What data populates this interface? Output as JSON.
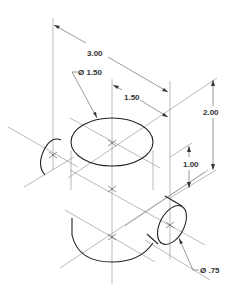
{
  "drawing": {
    "type": "isometric technical drawing",
    "dimensions": {
      "overall_length": "3.00",
      "large_diameter": "Ø 1.50",
      "center_offset": "1.50",
      "overall_height": "2.00",
      "boss_height": "1.00",
      "small_diameter": "Ø .75"
    },
    "colors": {
      "object_line": "#222222",
      "center_line": "#8a8a8a",
      "text": "#333333"
    }
  }
}
